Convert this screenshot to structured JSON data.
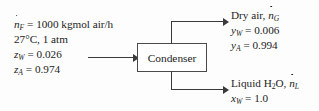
{
  "diagram": {
    "type": "process-flow-diagram",
    "unit": {
      "label": "Condenser"
    },
    "feed_stream": {
      "name": "feed",
      "lines": [
        {
          "symbol": "n",
          "dot": true,
          "sub": "F",
          "text": " = 1000 kgmol air/h"
        },
        {
          "plain": "27°C, 1 atm"
        },
        {
          "symbol": "z",
          "dot": false,
          "sub": "W",
          "text": " = 0.026"
        },
        {
          "symbol": "z",
          "dot": false,
          "sub": "A",
          "text": " = 0.974"
        }
      ],
      "flow_rate": "1000 kgmol air/h",
      "temperature": "27°C",
      "pressure": "1 atm",
      "z_W": "0.026",
      "z_A": "0.974"
    },
    "gas_outlet": {
      "name": "Dry air",
      "lines": [
        {
          "prefix": "Dry air, ",
          "symbol": "n",
          "dot": true,
          "sub": "G",
          "text": ""
        },
        {
          "symbol": "y",
          "dot": false,
          "sub": "W",
          "text": " = 0.006"
        },
        {
          "symbol": "y",
          "dot": false,
          "sub": "A",
          "text": " = 0.994"
        }
      ],
      "stream_symbol": "nG",
      "y_W": "0.006",
      "y_A": "0.994"
    },
    "liquid_outlet": {
      "name": "Liquid H2O",
      "lines": [
        {
          "prefix": "Liquid H",
          "subscript_number": "2",
          "suffix": "O, ",
          "symbol": "n",
          "dot": true,
          "sub": "L",
          "text": ""
        },
        {
          "symbol": "x",
          "dot": false,
          "sub": "W",
          "text": " = 1.0"
        }
      ],
      "stream_symbol": "nL",
      "x_W": "1.0"
    },
    "colors": {
      "background": "#fdfdfd",
      "line": "#3a3a3a",
      "box_border": "#4a4a4a",
      "text": "#1c1c1c"
    }
  }
}
